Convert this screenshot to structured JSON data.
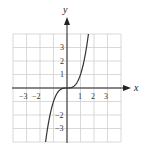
{
  "chart_data": {
    "type": "line",
    "title": "",
    "xlabel": "x",
    "ylabel": "y",
    "xlim": [
      -4,
      4
    ],
    "ylim": [
      -4,
      4
    ],
    "grid": true,
    "legend": null,
    "x_ticks": [
      "-3",
      "-2",
      "1",
      "2",
      "3"
    ],
    "y_ticks": [
      "3",
      "2",
      "1",
      "-2",
      "-3"
    ],
    "series": [
      {
        "name": "f(x) = x^3",
        "x": [
          -1.587,
          -1.5,
          -1.25,
          -1.0,
          -0.75,
          -0.5,
          -0.25,
          0,
          0.25,
          0.5,
          0.75,
          1.0,
          1.25,
          1.5,
          1.587
        ],
        "y": [
          -4.0,
          -3.375,
          -1.953,
          -1.0,
          -0.422,
          -0.125,
          -0.016,
          0,
          0.016,
          0.125,
          0.422,
          1.0,
          1.953,
          3.375,
          4.0
        ]
      }
    ],
    "colors": {
      "grid": "#cfcfcf",
      "axis": "#222222",
      "curve": "#333333"
    }
  },
  "labels": {
    "x_axis": "x",
    "y_axis": "y",
    "x_tick_m3": "−3",
    "x_tick_m2": "−2",
    "x_tick_1": "1",
    "x_tick_2": "2",
    "x_tick_3": "3",
    "y_tick_3": "3",
    "y_tick_2": "2",
    "y_tick_1": "1",
    "y_tick_m2": "−2",
    "y_tick_m3": "−3"
  }
}
